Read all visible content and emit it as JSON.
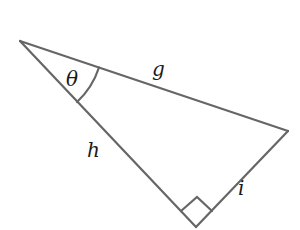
{
  "diagram": {
    "type": "right-triangle",
    "stroke_color": "#666666",
    "vertices": {
      "top_left": [
        20,
        41
      ],
      "right": [
        288,
        131
      ],
      "bottom_right_angle": [
        196,
        227
      ]
    },
    "labels": {
      "angle": "θ",
      "hypotenuse": "g",
      "left_leg": "h",
      "right_leg": "i"
    },
    "right_angle_marker": true,
    "angle_arc_at": "top_left"
  }
}
